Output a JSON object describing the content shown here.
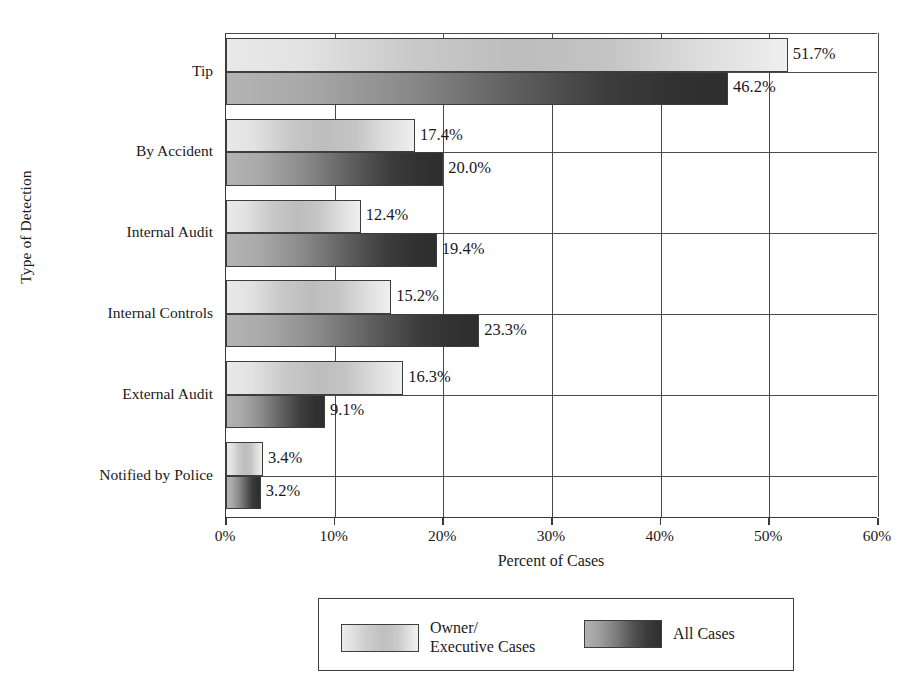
{
  "chart_data": {
    "type": "bar",
    "orientation": "horizontal",
    "title": "",
    "xlabel": "Percent of Cases",
    "ylabel": "Type of Detection",
    "xlim": [
      0,
      60
    ],
    "xticks": [
      "0%",
      "10%",
      "20%",
      "30%",
      "40%",
      "50%",
      "60%"
    ],
    "xtick_values": [
      0,
      10,
      20,
      30,
      40,
      50,
      60
    ],
    "grid": "vertical-and-group-separators",
    "legend_position": "bottom-center",
    "categories": [
      "Tip",
      "By Accident",
      "Internal Audit",
      "Internal Controls",
      "External Audit",
      "Notified by Police"
    ],
    "series": [
      {
        "name": "Owner/\nExecutive Cases",
        "name_line1": "Owner/",
        "name_line2": "Executive Cases",
        "style": "light-gradient",
        "values": [
          51.7,
          17.4,
          12.4,
          15.2,
          16.3,
          3.4
        ],
        "labels": [
          "51.7%",
          "17.4%",
          "12.4%",
          "15.2%",
          "16.3%",
          "3.4%"
        ]
      },
      {
        "name": "All Cases",
        "style": "dark-gradient",
        "values": [
          46.2,
          20.0,
          19.4,
          23.3,
          9.1,
          3.2
        ],
        "labels": [
          "46.2%",
          "20.0%",
          "19.4%",
          "23.3%",
          "9.1%",
          "3.2%"
        ]
      }
    ],
    "colors": {
      "light_series_start": "#e9e9e9",
      "light_series_mid": "#bdbdbd",
      "light_series_end": "#efefef",
      "dark_series_start": "#b4b4b4",
      "dark_series_mid": "#5e5e5e",
      "dark_series_end": "#2e2e2e",
      "axis": "#3a3a3a",
      "grid": "#4a4a4a",
      "text": "#1a1a1a",
      "background": "#ffffff"
    }
  },
  "legend": {
    "items": [
      {
        "label_line1": "Owner/",
        "label_line2": "Executive Cases"
      },
      {
        "label_line1": "All Cases",
        "label_line2": ""
      }
    ]
  }
}
